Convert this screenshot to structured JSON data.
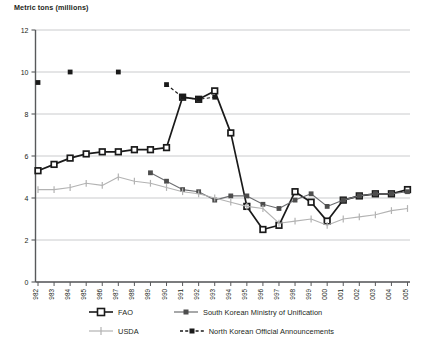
{
  "chart_data": {
    "type": "line",
    "title": "",
    "ylabel": "Metric tons (millions)",
    "xlabel": "",
    "ylim": [
      0,
      12
    ],
    "yticks": [
      0,
      2,
      4,
      6,
      8,
      10,
      12
    ],
    "grid": true,
    "legend_position": "bottom",
    "categories": [
      "1982",
      "1983",
      "1984",
      "1985",
      "1986",
      "1987",
      "1988",
      "1989",
      "1990",
      "1991",
      "1992",
      "1993",
      "1994",
      "1995",
      "1996",
      "1997",
      "1998",
      "1999",
      "2000",
      "2001",
      "2002",
      "2003",
      "2004",
      "2005"
    ],
    "series": [
      {
        "name": "FAO",
        "color": "#1a1a1a",
        "marker": "open-square",
        "dash": "solid",
        "values": [
          5.3,
          5.6,
          5.9,
          6.1,
          6.2,
          6.2,
          6.3,
          6.3,
          6.4,
          8.8,
          8.7,
          9.1,
          7.1,
          3.6,
          2.5,
          2.7,
          4.3,
          3.8,
          2.9,
          3.9,
          4.1,
          4.2,
          4.2,
          4.4
        ]
      },
      {
        "name": "South Korean Ministry of Unification",
        "color": "#6d6e71",
        "marker": "filled-square",
        "dash": "solid",
        "values": [
          null,
          null,
          null,
          null,
          null,
          null,
          null,
          5.2,
          4.8,
          4.4,
          4.3,
          3.9,
          4.1,
          4.1,
          3.7,
          3.5,
          3.9,
          4.2,
          3.6,
          3.9,
          4.1,
          4.2,
          4.2,
          4.3
        ]
      },
      {
        "name": "USDA",
        "color": "#b3b3b3",
        "marker": "plus",
        "dash": "solid",
        "values": [
          4.4,
          4.4,
          4.5,
          4.7,
          4.6,
          5.0,
          4.8,
          4.7,
          4.5,
          4.3,
          4.2,
          4.0,
          3.8,
          3.6,
          3.5,
          2.8,
          2.9,
          3.0,
          2.7,
          3.0,
          3.1,
          3.2,
          3.4,
          3.5
        ]
      },
      {
        "name": "North Korean Official Announcements",
        "color": "#1a1a1a",
        "marker": "filled-square",
        "dash": "dashed",
        "values": [
          9.5,
          null,
          10.0,
          null,
          null,
          10.0,
          null,
          null,
          9.4,
          8.8,
          8.7,
          8.8,
          null,
          null,
          null,
          null,
          null,
          null,
          null,
          null,
          null,
          null,
          null,
          null
        ]
      }
    ]
  },
  "legend": {
    "items": [
      {
        "label": "FAO",
        "key": "fao"
      },
      {
        "label": "South Korean Ministry of Unification",
        "key": "mou"
      },
      {
        "label": "USDA",
        "key": "usda"
      },
      {
        "label": "North Korean Official Announcements",
        "key": "nk"
      }
    ]
  }
}
